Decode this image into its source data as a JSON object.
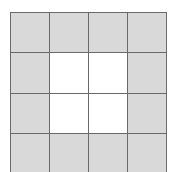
{
  "diagram": {
    "type": "grid",
    "rows": 4,
    "cols": 4,
    "colors": {
      "shaded": "#d9d9d9",
      "empty": "#ffffff",
      "line": "#6a6a6a"
    },
    "cells": [
      [
        "shaded",
        "shaded",
        "shaded",
        "shaded"
      ],
      [
        "shaded",
        "empty",
        "empty",
        "shaded"
      ],
      [
        "shaded",
        "empty",
        "empty",
        "shaded"
      ],
      [
        "shaded",
        "shaded",
        "shaded",
        "shaded"
      ]
    ]
  }
}
